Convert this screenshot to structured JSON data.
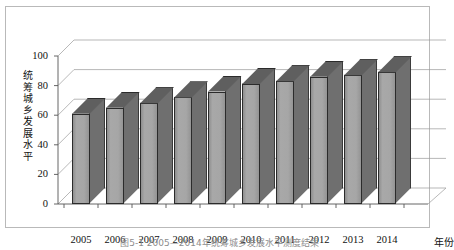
{
  "figure": {
    "caption": "图5-1  2005—2014年统筹城乡发展水平测度结果",
    "border_color": "#b9b9b9",
    "background": "#ffffff"
  },
  "chart_data": {
    "type": "bar",
    "title": "",
    "subtitle": "",
    "xlabel": "年份",
    "ylabel": "统筹城乡发展水平",
    "ylabel_chars": [
      "统",
      "筹",
      "城",
      "乡",
      "发",
      "展",
      "水",
      "平"
    ],
    "categories": [
      "2005",
      "2006",
      "2007",
      "2008",
      "2009",
      "2010",
      "2011",
      "2012",
      "2013",
      "2014"
    ],
    "values": [
      61,
      65,
      68,
      72,
      76,
      81,
      83,
      86,
      87,
      89
    ],
    "series": [
      {
        "name": "统筹城乡发展水平",
        "values": [
          61,
          65,
          68,
          72,
          76,
          81,
          83,
          86,
          87,
          89
        ]
      }
    ],
    "ylim": [
      0,
      100
    ],
    "ytick_labels": [
      "0",
      "20",
      "40",
      "60",
      "80",
      "100"
    ],
    "ytick_values": [
      0,
      20,
      40,
      60,
      80,
      100
    ],
    "grid": true,
    "grid_axis": "y",
    "legend": false,
    "legend_position": "none",
    "three_d": true,
    "bar_face_color": "#a6a6a6",
    "bar_side_color": "#6f6f6f",
    "bar_top_color": "#5f5f5f",
    "bar_edge_color": "#2b2b2b",
    "gridline_color": "#9a9a9a",
    "axis_color": "#555555"
  }
}
